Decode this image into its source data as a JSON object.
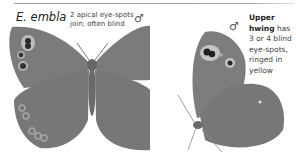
{
  "species": "E. embla",
  "annotations": {
    "left": {
      "line1": "2 apical eye-spots",
      "line2": "join; often blind"
    },
    "right": {
      "bold1": "Upper",
      "bold2": "hwing",
      "rest2": " has",
      "line3": "3 or 4 blind",
      "line4": "eye-spots,",
      "line5": "ringed in",
      "line6": "yellow"
    }
  },
  "sex_symbols": {
    "upperside": "♂",
    "underside": "♂"
  },
  "colors": {
    "wing": "#7b7b7b",
    "wing_dark": "#6a6a6a",
    "spot_ring": "#bdbdbd",
    "spot_center": "#2a2a2a"
  }
}
